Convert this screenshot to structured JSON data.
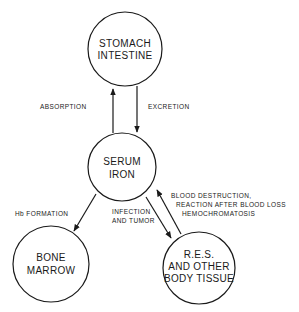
{
  "nodes": {
    "stomach": {
      "line1": "STOMACH",
      "line2": "INTESTINE"
    },
    "serum": {
      "line1": "SERUM",
      "line2": "IRON"
    },
    "marrow": {
      "line1": "BONE",
      "line2": "MARROW"
    },
    "res": {
      "line1": "R.E.S.",
      "line2": "AND OTHER",
      "line3": "BODY TISSUE"
    }
  },
  "edges": {
    "absorption": {
      "label": "ABSORPTION"
    },
    "excretion": {
      "label": "EXCRETION"
    },
    "hb_formation": {
      "label": "Hb  FORMATION"
    },
    "infection": {
      "line1": "INFECTION",
      "line2": "AND TUMOR"
    },
    "blood_destruction": {
      "line1": "BLOOD DESTRUCTION,",
      "line2": "REACTION AFTER BLOOD LOSS",
      "line3": "HEMOCHROMATOSIS"
    }
  },
  "colors": {
    "ink": "#1a1a1a",
    "background": "#ffffff"
  }
}
